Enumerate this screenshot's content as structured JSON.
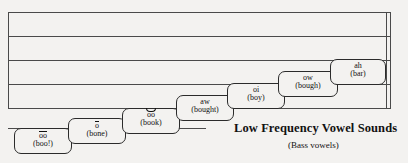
{
  "figure": {
    "caption_title": "Low Frequency Vowel Sounds",
    "caption_subtitle": "(Bass vowels)"
  },
  "staff": {
    "line_color": "#4a4a4a",
    "line_count": 5,
    "ledger_line_count": 1,
    "has_double_barline_right": true
  },
  "vowels": [
    {
      "symbol": "oo",
      "diacritic": "macron",
      "word": "(boo!)"
    },
    {
      "symbol": "o",
      "diacritic": "macron",
      "word": "(bone)"
    },
    {
      "symbol": "oo",
      "diacritic": "breve",
      "word": "(book)"
    },
    {
      "symbol": "aw",
      "diacritic": "none",
      "word": "(bought)"
    },
    {
      "symbol": "oi",
      "diacritic": "none",
      "word": "(boy)"
    },
    {
      "symbol": "ow",
      "diacritic": "none",
      "word": "(bough)"
    },
    {
      "symbol": "ah",
      "diacritic": "none",
      "word": "(bar)"
    }
  ],
  "colors": {
    "background": "#f3f2f0",
    "ink": "#111111",
    "staff": "#4a4a4a"
  }
}
